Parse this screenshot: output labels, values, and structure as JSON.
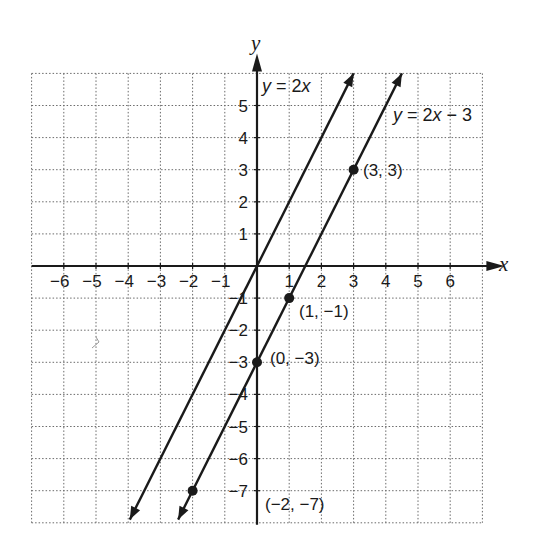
{
  "chart_data": {
    "type": "line",
    "title": "",
    "xlabel": "x",
    "ylabel": "y",
    "xlim": [
      -7,
      7
    ],
    "ylim": [
      -8,
      6
    ],
    "grid": true,
    "grid_style": "dotted",
    "x_ticks": [
      -6,
      -5,
      -4,
      -3,
      -2,
      -1,
      1,
      2,
      3,
      4,
      5,
      6
    ],
    "y_ticks": [
      5,
      4,
      3,
      2,
      1,
      -1,
      -2,
      -3,
      -4,
      -5,
      -6,
      -7
    ],
    "x_tick_labels": [
      "−6",
      "−5",
      "−4",
      "−3",
      "−2",
      "−1",
      "1",
      "2",
      "3",
      "4",
      "5",
      "6"
    ],
    "y_tick_labels": [
      "5",
      "4",
      "3",
      "2",
      "1",
      "−1",
      "−2",
      "−3",
      "−4",
      "−5",
      "−6",
      "−7"
    ],
    "series": [
      {
        "name": "y = 2x",
        "equation": "y = 2x",
        "slope": 2,
        "intercept": 0,
        "x_range": [
          -3.95,
          3.0
        ],
        "arrows": "both",
        "points": []
      },
      {
        "name": "y = 2x − 3",
        "equation": "y = 2x − 3",
        "slope": 2,
        "intercept": -3,
        "x_range": [
          -2.45,
          4.5
        ],
        "arrows": "both",
        "points": [
          {
            "x": 3,
            "y": 3,
            "label": "(3, 3)"
          },
          {
            "x": 1,
            "y": -1,
            "label": "(1, −1)"
          },
          {
            "x": 0,
            "y": -3,
            "label": "(0, −3)"
          },
          {
            "x": -2,
            "y": -7,
            "label": "(−2, −7)"
          }
        ]
      }
    ],
    "annotations": [
      {
        "text": "y = 2x",
        "near": "top of line y = 2x"
      },
      {
        "text": "y = 2x − 3",
        "near": "upper right of line y = 2x − 3"
      },
      {
        "text": "(3, 3)",
        "x": 3,
        "y": 3
      },
      {
        "text": "(1, −1)",
        "x": 1,
        "y": -1
      },
      {
        "text": "(0, −3)",
        "x": 0,
        "y": -3
      },
      {
        "text": "(−2, −7)",
        "x": -2,
        "y": -7
      }
    ],
    "legend": null
  },
  "labels": {
    "x_axis": "x",
    "y_axis": "y",
    "eq1_y": "y",
    "eq1_rest": " = 2",
    "eq1_x": "x",
    "eq2_y": "y",
    "eq2_mid": " = 2",
    "eq2_x": "x",
    "eq2_rest": " − 3",
    "pt_3_3": "(3, 3)",
    "pt_1_m1": "(1, −1)",
    "pt_0_m3": "(0, −3)",
    "pt_m2_m7": "(−2, −7)"
  }
}
